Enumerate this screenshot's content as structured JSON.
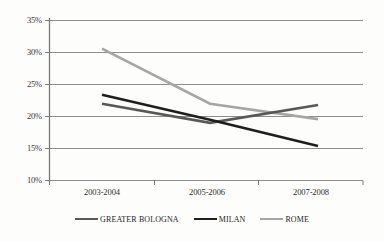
{
  "chart_data": {
    "type": "line",
    "title": "",
    "subtitle": "",
    "xlabel": "",
    "ylabel": "",
    "categories": [
      "2003-2004",
      "2005-2006",
      "2007-2008"
    ],
    "series": [
      {
        "name": "GREATER BOLOGNA",
        "color": "#595959",
        "values": [
          22.0,
          19.0,
          21.8
        ],
        "value_labels": [
          "22%",
          "19%",
          "21.8%"
        ]
      },
      {
        "name": "MILAN",
        "color": "#1f1f1f",
        "values": [
          23.4,
          19.5,
          15.4
        ],
        "value_labels": [
          "23.4%",
          "19.5%",
          "15.4%"
        ]
      },
      {
        "name": "ROME",
        "color": "#a6a6a6",
        "values": [
          30.6,
          22.0,
          19.6
        ],
        "value_labels": [
          "30.6%",
          "22%",
          "19.6%"
        ]
      }
    ],
    "ylim": [
      10,
      35
    ],
    "ytick_values": [
      35,
      30,
      25,
      20,
      15,
      10
    ],
    "ytick_labels": [
      "35%",
      "30%",
      "25%",
      "20%",
      "15%",
      "10%"
    ],
    "grid": true,
    "grid_axis": "y",
    "legend_position": "bottom",
    "legend_entries": [
      "GREATER BOLOGNA",
      "MILAN",
      "ROME"
    ],
    "annotations": [],
    "colors": {
      "grid": "#8c8c8c",
      "axis": "#7a7a7a",
      "text": "#2e2e2e",
      "background": "#fdfdfc"
    }
  }
}
